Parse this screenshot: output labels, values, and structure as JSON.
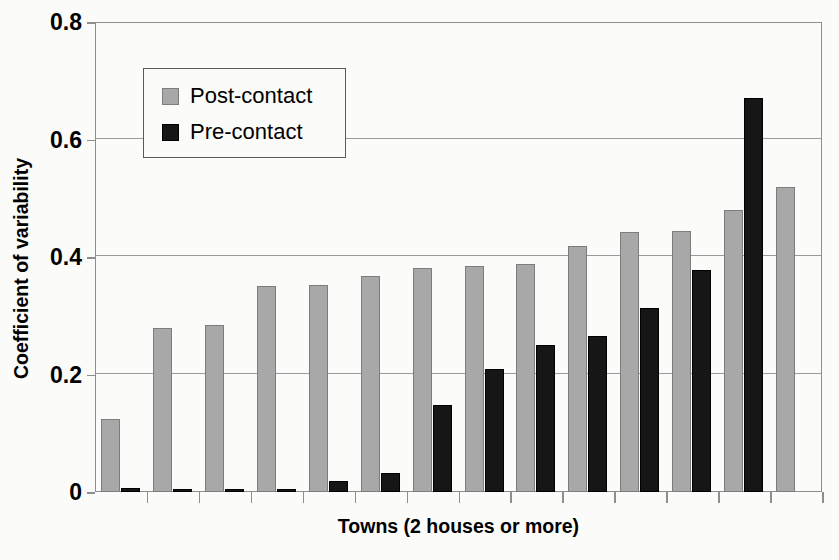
{
  "chart_data": {
    "type": "bar",
    "title": "",
    "xlabel": "Towns (2 houses or more)",
    "ylabel": "Coefficient of variability",
    "ylim": [
      0,
      0.8
    ],
    "yticks": [
      "0",
      "0.2",
      "0.4",
      "0.6",
      "0.8"
    ],
    "ytick_values": [
      0,
      0.2,
      0.4,
      0.6,
      0.8
    ],
    "grid": true,
    "legend_position": "upper-left-inside",
    "xtick_labels": [],
    "categories": [
      "1",
      "2",
      "3",
      "4",
      "5",
      "6",
      "7",
      "8",
      "9",
      "10",
      "11",
      "12",
      "13",
      "14"
    ],
    "series": [
      {
        "name": "Post-contact",
        "color": "#a8a8a8",
        "values": [
          0.125,
          0.28,
          0.285,
          0.35,
          0.352,
          0.367,
          0.382,
          0.385,
          0.388,
          0.418,
          0.442,
          0.445,
          0.48,
          0.52
        ]
      },
      {
        "name": "Pre-contact",
        "color": "#161616",
        "values": [
          0.006,
          0.005,
          0.005,
          0.005,
          0.018,
          0.032,
          0.148,
          0.21,
          0.25,
          0.265,
          0.313,
          0.378,
          0.67,
          0
        ]
      }
    ]
  },
  "legend": {
    "items": [
      {
        "label": "Post-contact",
        "swatch": "post"
      },
      {
        "label": "Pre-contact",
        "swatch": "pre"
      }
    ]
  },
  "axes": {
    "y_title": "Coefficient of variability",
    "x_title": "Towns (2 houses or more)"
  }
}
